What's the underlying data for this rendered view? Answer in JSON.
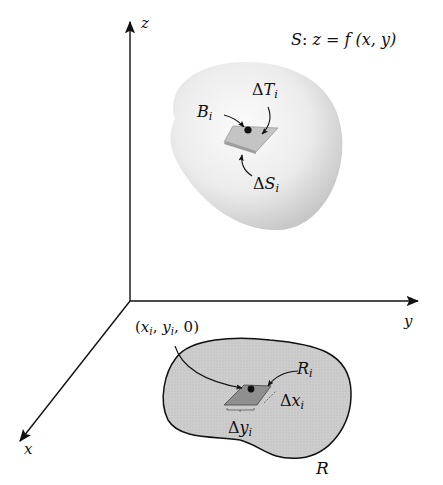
{
  "figure": {
    "axes": {
      "x": "x",
      "y": "y",
      "z": "z"
    },
    "surface_equation": {
      "prefix": "S",
      "colon": ":",
      "eq": "z = f (x, y)"
    },
    "labels": {
      "delta_T": {
        "delta": "Δ",
        "name": "T",
        "sub": "i"
      },
      "B": {
        "name": "B",
        "sub": "i"
      },
      "delta_S": {
        "delta": "Δ",
        "name": "S",
        "sub": "i"
      },
      "point": {
        "open": "(",
        "x": "x",
        "xsub": "i",
        "sep1": ", ",
        "y": "y",
        "ysub": "i",
        "tail": ", 0)"
      },
      "R_i": {
        "name": "R",
        "sub": "i"
      },
      "delta_x": {
        "delta": "Δ",
        "name": "x",
        "sub": "i"
      },
      "delta_y": {
        "delta": "Δ",
        "name": "y",
        "sub": "i"
      },
      "R": "R"
    },
    "colors": {
      "axis": "#111111",
      "surface_light": "#f6f6f6",
      "surface_shade": "#cfcfcf",
      "region_fill": "#c9c9c9",
      "patch_fill": "#a9a9a9",
      "tangent_fill": "#bdbdbd"
    }
  }
}
